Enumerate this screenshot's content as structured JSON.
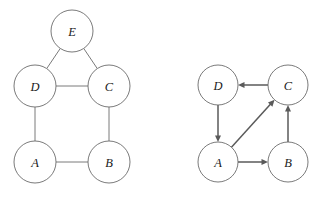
{
  "figure": {
    "background_color": "#ffffff",
    "stroke_color": "#6b6b6b",
    "arrow_color": "#5a5a5a",
    "label_color": "#1a1a1a",
    "width": 324,
    "height": 197
  },
  "graphs": [
    {
      "id": "left-graph",
      "kind": "undirected",
      "nodes": [
        {
          "id": "E",
          "label": "E",
          "cx": 72,
          "cy": 31,
          "r": 21
        },
        {
          "id": "D",
          "label": "D",
          "cx": 35,
          "cy": 86,
          "r": 21
        },
        {
          "id": "C",
          "label": "C",
          "cx": 109,
          "cy": 86,
          "r": 21
        },
        {
          "id": "A",
          "label": "A",
          "cx": 35,
          "cy": 162,
          "r": 21
        },
        {
          "id": "B",
          "label": "B",
          "cx": 109,
          "cy": 162,
          "r": 21
        }
      ],
      "edges": [
        {
          "from": "E",
          "to": "D"
        },
        {
          "from": "E",
          "to": "C"
        },
        {
          "from": "D",
          "to": "C"
        },
        {
          "from": "D",
          "to": "A"
        },
        {
          "from": "C",
          "to": "B"
        },
        {
          "from": "A",
          "to": "B"
        }
      ]
    },
    {
      "id": "right-graph",
      "kind": "directed",
      "nodes": [
        {
          "id": "D",
          "label": "D",
          "cx": 218,
          "cy": 85,
          "r": 20
        },
        {
          "id": "C",
          "label": "C",
          "cx": 288,
          "cy": 85,
          "r": 20
        },
        {
          "id": "A",
          "label": "A",
          "cx": 218,
          "cy": 162,
          "r": 20
        },
        {
          "id": "B",
          "label": "B",
          "cx": 288,
          "cy": 162,
          "r": 20
        }
      ],
      "edges": [
        {
          "from": "C",
          "to": "D"
        },
        {
          "from": "D",
          "to": "A"
        },
        {
          "from": "A",
          "to": "C"
        },
        {
          "from": "A",
          "to": "B"
        },
        {
          "from": "B",
          "to": "C"
        }
      ]
    }
  ]
}
